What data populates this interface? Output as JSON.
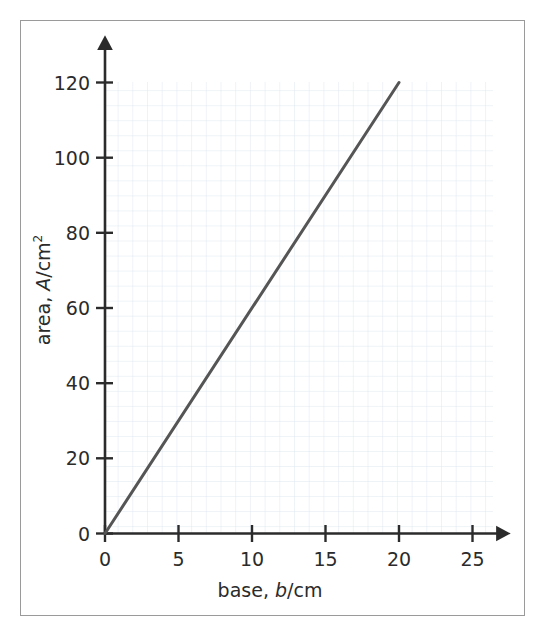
{
  "figure": {
    "frame_color": "#9a9a9a",
    "background_color": "#ffffff"
  },
  "chart_data": {
    "type": "line",
    "title": "",
    "subtitle": "",
    "xlabel_parts": {
      "prefix": "base, ",
      "variable": "b",
      "suffix": "/cm"
    },
    "ylabel_parts": {
      "prefix": "area, ",
      "variable": "A",
      "suffix": "/cm",
      "superscript": "2"
    },
    "xlabel": "base, b/cm",
    "ylabel": "area, A/cm2",
    "xlim": [
      0,
      25
    ],
    "ylim": [
      0,
      120
    ],
    "xticks": [
      0,
      5,
      10,
      15,
      20,
      25
    ],
    "xtick_labels": [
      "0",
      "5",
      "10",
      "15",
      "20",
      "25"
    ],
    "yticks": [
      0,
      20,
      40,
      60,
      80,
      100,
      120
    ],
    "ytick_labels": [
      "0",
      "20",
      "40",
      "60",
      "80",
      "100",
      "120"
    ],
    "grid": true,
    "grid_minor_spacing_x": 1,
    "grid_minor_spacing_y": 4,
    "grid_color": "#d9e2ec",
    "legend": null,
    "axis_style": "arrow-tipped",
    "axis_color": "#2b2b2b",
    "line_color": "#555555",
    "line_width": 3,
    "series": [
      {
        "name": "area vs base",
        "x": [
          0,
          20
        ],
        "y": [
          0,
          120
        ],
        "points": [
          {
            "x": 0,
            "y": 0
          },
          {
            "x": 5,
            "y": 30
          },
          {
            "x": 10,
            "y": 60
          },
          {
            "x": 15,
            "y": 90
          },
          {
            "x": 20,
            "y": 120
          }
        ],
        "slope": 6,
        "intercept": 0
      }
    ],
    "annotations": []
  }
}
